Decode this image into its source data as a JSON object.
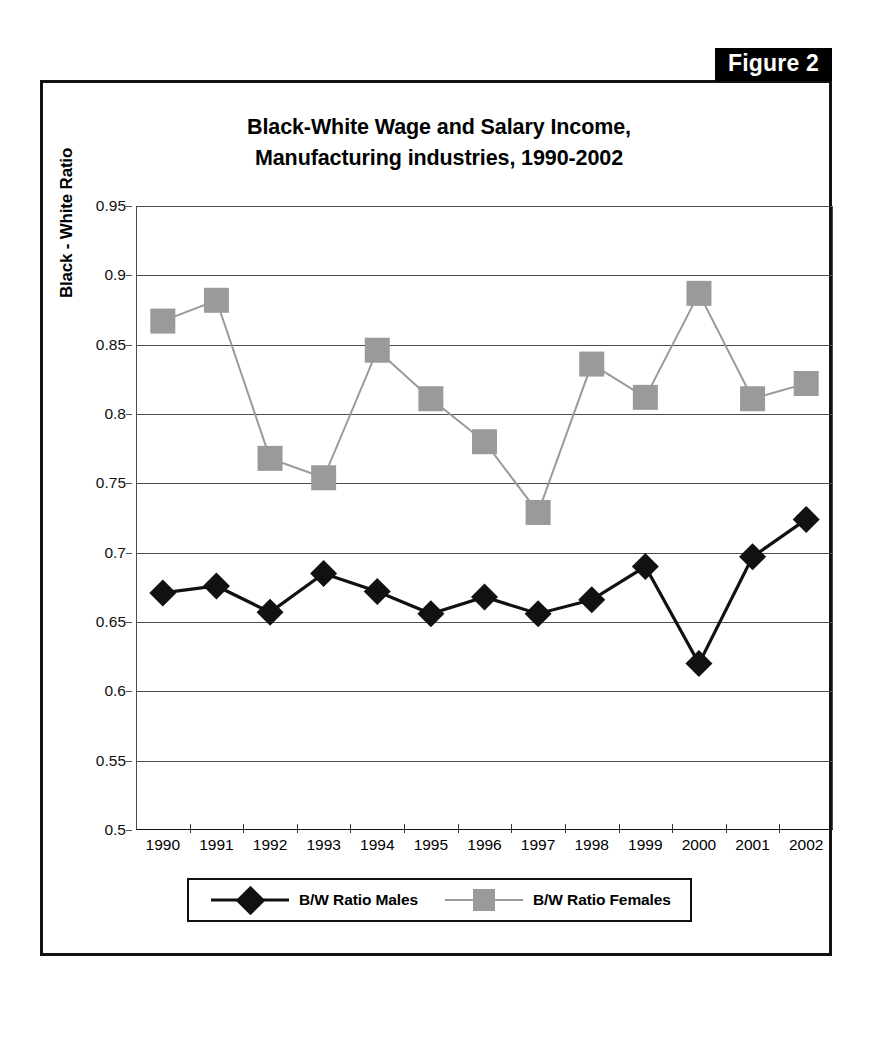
{
  "page_header": {
    "text": ""
  },
  "figure_label": "Figure 2",
  "chart_data": {
    "type": "line",
    "title": "Black-White Wage and Salary Income,\nManufacturing industries, 1990-2002",
    "title_line1": "Black-White Wage and Salary Income,",
    "title_line2": "Manufacturing industries, 1990-2002",
    "xlabel": "",
    "ylabel": "Black - White Ratio",
    "ylim": [
      0.5,
      0.95
    ],
    "ytick_labels": [
      "0.95",
      "0.9",
      "0.85",
      "0.8",
      "0.75",
      "0.7",
      "0.65",
      "0.6",
      "0.55",
      "0.5"
    ],
    "ytick_values": [
      0.95,
      0.9,
      0.85,
      0.8,
      0.75,
      0.7,
      0.65,
      0.6,
      0.55,
      0.5
    ],
    "grid": true,
    "legend_position": "bottom",
    "categories": [
      "1990",
      "1991",
      "1992",
      "1993",
      "1994",
      "1995",
      "1996",
      "1997",
      "1998",
      "1999",
      "2000",
      "2001",
      "2002"
    ],
    "series": [
      {
        "name": "B/W Ratio Males",
        "marker": "diamond",
        "color": "#111111",
        "values": [
          0.671,
          0.676,
          0.657,
          0.685,
          0.672,
          0.656,
          0.668,
          0.656,
          0.666,
          0.69,
          0.62,
          0.697,
          0.724
        ]
      },
      {
        "name": "B/W Ratio Females",
        "marker": "square",
        "color": "#9a9a9a",
        "values": [
          0.867,
          0.882,
          0.768,
          0.754,
          0.846,
          0.811,
          0.78,
          0.729,
          0.836,
          0.812,
          0.887,
          0.811,
          0.822
        ]
      }
    ]
  },
  "legend": {
    "entries": [
      {
        "label": "B/W Ratio Males",
        "marker": "diamond",
        "color": "#111111"
      },
      {
        "label": "B/W Ratio Females",
        "marker": "square",
        "color": "#9a9a9a"
      }
    ]
  },
  "colors": {
    "males": "#111111",
    "females": "#9a9a9a",
    "grid": "#4d4d4d",
    "frame": "#111111",
    "figure_tab_bg": "#000000",
    "figure_tab_text": "#ffffff"
  }
}
